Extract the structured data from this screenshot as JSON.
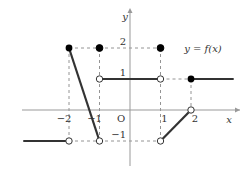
{
  "chart_data": {
    "type": "line",
    "title": "",
    "function_label": "y = f(x)",
    "xlabel": "x",
    "ylabel": "y",
    "origin_label": "O",
    "x_ticks": [
      {
        "value": -2,
        "label": "−2"
      },
      {
        "value": -1,
        "label": "−1"
      },
      {
        "value": 1,
        "label": "1"
      },
      {
        "value": 2,
        "label": "2"
      }
    ],
    "y_ticks": [
      {
        "value": 2,
        "label": "2"
      },
      {
        "value": 1,
        "label": "1"
      },
      {
        "value": -1,
        "label": "−1"
      }
    ],
    "xlim": [
      -3.5,
      3.4
    ],
    "ylim": [
      -1.8,
      3.5
    ],
    "pieces": [
      {
        "from": [
          -3.5,
          -1
        ],
        "to": [
          -2,
          -1
        ],
        "start": "none",
        "end": "open"
      },
      {
        "from": [
          -2,
          2
        ],
        "to": [
          -1,
          -1
        ],
        "start": "closed",
        "end": "open"
      },
      {
        "from": [
          -1,
          1
        ],
        "to": [
          1,
          1
        ],
        "start": "open",
        "end": "open"
      },
      {
        "from": [
          1,
          -1
        ],
        "to": [
          2,
          0
        ],
        "start": "open",
        "end": "open"
      },
      {
        "from": [
          2,
          1
        ],
        "to": [
          3.4,
          1
        ],
        "start": "closed",
        "end": "none"
      }
    ],
    "isolated_points": [
      {
        "x": -1,
        "y": 2,
        "type": "closed"
      },
      {
        "x": 1,
        "y": 2,
        "type": "closed"
      }
    ],
    "guides": "dashed",
    "grid": false,
    "legend": "none"
  }
}
